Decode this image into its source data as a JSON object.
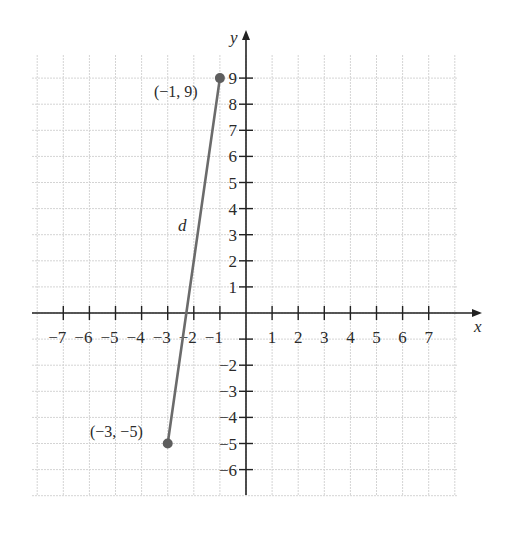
{
  "chart_data": {
    "type": "scatter",
    "title": "",
    "xlabel": "x",
    "ylabel": "y",
    "xlim": [
      -8.5,
      8
    ],
    "ylim": [
      -7,
      10
    ],
    "grid": true,
    "x_ticks": [
      -7,
      -6,
      -5,
      -4,
      -3,
      -2,
      -1,
      1,
      2,
      3,
      4,
      5,
      6,
      7
    ],
    "y_ticks": [
      -6,
      -5,
      -4,
      -3,
      -2,
      -1,
      1,
      2,
      3,
      4,
      5,
      6,
      7,
      8,
      9
    ],
    "x_tick_labels": [
      "−7",
      "−6",
      "−5",
      "−4",
      "−3",
      "−2",
      "−1",
      "1",
      "2",
      "3",
      "4",
      "5",
      "6",
      "7"
    ],
    "y_tick_labels": [
      "−6",
      "−5",
      "−4",
      "−3",
      "−2",
      "",
      "1",
      "2",
      "3",
      "4",
      "5",
      "6",
      "7",
      "8",
      "9"
    ],
    "points": [
      {
        "x": -1,
        "y": 9,
        "label": "(−1, 9)"
      },
      {
        "x": -3,
        "y": -5,
        "label": "(−3, −5)"
      }
    ],
    "segments": [
      {
        "from": [
          -3,
          -5
        ],
        "to": [
          -1,
          9
        ],
        "label": "d"
      }
    ],
    "colors": {
      "segment": "#6b6b6b",
      "point": "#5e5e5e",
      "axis": "#222222",
      "grid": "#d4d4d4"
    }
  },
  "labels": {
    "x_axis": "x",
    "y_axis": "y",
    "segment": "d",
    "point_top": "(−1, 9)",
    "point_bottom": "(−3, −5)"
  }
}
